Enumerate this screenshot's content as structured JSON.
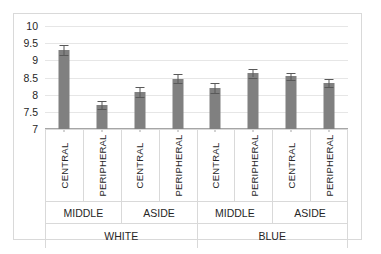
{
  "chart_data": {
    "type": "bar",
    "title": "",
    "subtitle": "",
    "xlabel": "",
    "ylabel": "",
    "ylim": [
      7,
      10
    ],
    "yticks": [
      "7",
      "7.5",
      "8",
      "8.5",
      "9",
      "9.5",
      "10"
    ],
    "ytick_values": [
      7,
      7.5,
      8,
      8.5,
      9,
      9.5,
      10
    ],
    "grid": true,
    "legend": false,
    "legend_position": "none",
    "bar_color": "#808080",
    "error_color": "#595959",
    "grid_color": "#e6e6e6",
    "axis_color": "#a6a6a6",
    "frame_color": "#d9d9d9",
    "categories": [
      "CENTRAL",
      "PERIPHERAL",
      "CENTRAL",
      "PERIPHERAL",
      "CENTRAL",
      "PERIPHERAL",
      "CENTRAL",
      "PERIPHERAL"
    ],
    "values": [
      9.3,
      7.7,
      8.07,
      8.47,
      8.2,
      8.62,
      8.53,
      8.33
    ],
    "errors": [
      0.14,
      0.13,
      0.14,
      0.12,
      0.14,
      0.12,
      0.11,
      0.12
    ],
    "group_level_2": [
      "MIDDLE",
      "ASIDE",
      "MIDDLE",
      "ASIDE"
    ],
    "group_level_3": [
      "WHITE",
      "BLUE"
    ],
    "bars": [
      {
        "label": "CENTRAL",
        "value": 9.3,
        "error": 0.14,
        "group2": "MIDDLE",
        "group3": "WHITE"
      },
      {
        "label": "PERIPHERAL",
        "value": 7.7,
        "error": 0.13,
        "group2": "MIDDLE",
        "group3": "WHITE"
      },
      {
        "label": "CENTRAL",
        "value": 8.07,
        "error": 0.14,
        "group2": "ASIDE",
        "group3": "WHITE"
      },
      {
        "label": "PERIPHERAL",
        "value": 8.47,
        "error": 0.12,
        "group2": "ASIDE",
        "group3": "WHITE"
      },
      {
        "label": "CENTRAL",
        "value": 8.2,
        "error": 0.14,
        "group2": "MIDDLE",
        "group3": "BLUE"
      },
      {
        "label": "PERIPHERAL",
        "value": 8.62,
        "error": 0.12,
        "group2": "MIDDLE",
        "group3": "BLUE"
      },
      {
        "label": "CENTRAL",
        "value": 8.53,
        "error": 0.11,
        "group2": "ASIDE",
        "group3": "BLUE"
      },
      {
        "label": "PERIPHERAL",
        "value": 8.33,
        "error": 0.12,
        "group2": "ASIDE",
        "group3": "BLUE"
      }
    ]
  }
}
